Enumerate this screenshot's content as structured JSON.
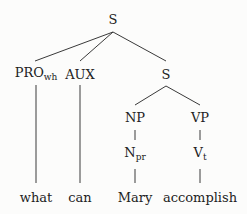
{
  "tree": {
    "root": {
      "label": "S"
    },
    "pro": {
      "label": "PRO",
      "sub": "wh",
      "word": "what"
    },
    "aux": {
      "label": "AUX",
      "word": "can"
    },
    "s2": {
      "label": "S"
    },
    "np": {
      "label": "NP"
    },
    "npr": {
      "label": "N",
      "sub": "pr",
      "word": "Mary"
    },
    "vp": {
      "label": "VP"
    },
    "vt": {
      "label": "V",
      "sub": "t",
      "word": "accomplish"
    }
  },
  "colors": {
    "line": "#333333",
    "text": "#222222"
  }
}
